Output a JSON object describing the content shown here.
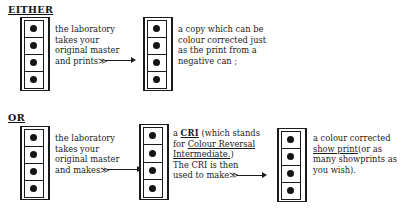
{
  "diagram": {
    "title_a": "EITHER",
    "title_b": "OR",
    "branches": [
      {
        "label": "EITHER",
        "steps": [
          {
            "strip": "filmstrip-original-master",
            "frames": 4,
            "text_lines": [
              "the laboratory",
              "takes your",
              "original master",
              "and prints"
            ],
            "arrow": "≫——→"
          },
          {
            "strip": "filmstrip-colour-copy",
            "frames": 4,
            "text_lines": [
              "a copy which can be",
              "colour corrected just",
              "as the print from a",
              "negative can ;"
            ]
          }
        ]
      },
      {
        "label": "OR",
        "steps": [
          {
            "strip": "filmstrip-original-master-2",
            "frames": 4,
            "text_lines": [
              "the laboratory",
              "takes your",
              "original master",
              "and makes"
            ],
            "arrow": "≫——→"
          },
          {
            "strip": "filmstrip-cri",
            "frames": 4,
            "text_lines": [
              "a CRI (which stands",
              "for Colour Reversal",
              "Intermediate.)",
              "The CRI is then",
              "used to make"
            ],
            "acronym": "CRI",
            "expansion_line1": "Colour Reversal",
            "expansion_line2": "Intermediate.",
            "arrow": "≫——→"
          },
          {
            "strip": "filmstrip-showprint",
            "frames": 4,
            "text_lines": [
              "a colour corrected",
              "show print(or as",
              "many showprints as",
              "you wish)."
            ],
            "underlined_term": "show print"
          }
        ]
      }
    ]
  },
  "text": {
    "t1_l1": "the laboratory",
    "t1_l2": "takes your",
    "t1_l3": "original master",
    "t1_l4": "and prints",
    "t2_l1": "a copy which can be",
    "t2_l2": "colour corrected just",
    "t2_l3": "as the print from a",
    "t2_l4": "negative can ;",
    "t3_l1": "the laboratory",
    "t3_l2": "takes your",
    "t3_l3": "original master",
    "t3_l4": "and makes",
    "t4_a": "a ",
    "t4_acronym": "CRI",
    "t4_b": " (which stands",
    "t4_l2a": "for ",
    "t4_l2u": "Colour Reversal",
    "t4_l3u": "Intermediate.",
    "t4_l3b": ")",
    "t4_l4": "The CRI is then",
    "t4_l5": "used to make",
    "t5_l1": "a colour corrected",
    "t5_l2u": "show print",
    "t5_l2b": "(or as",
    "t5_l3": "many showprints as",
    "t5_l4": "you wish)."
  },
  "icons": {
    "chevron_double": "≫",
    "arrow_right": "→"
  },
  "colors": {
    "ink": "#1a1a1a",
    "paper": "#ffffff"
  }
}
